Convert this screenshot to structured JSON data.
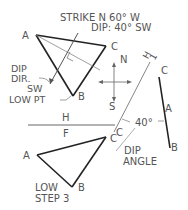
{
  "header": {
    "strike": "STRIKE  N 60° W",
    "dip": "DIP: 40° SW"
  },
  "top_view": {
    "vertex_a": "A",
    "vertex_b": "B",
    "vertex_c": "C",
    "dip_dir_line1": "DIP",
    "dip_dir_line2": "DIR.",
    "dip_dir_line3": "SW",
    "low_point": "LOW PT"
  },
  "compass": {
    "north": "N",
    "south": "S"
  },
  "fold_line": {
    "upper": "H",
    "lower": "F",
    "aux_h": "H",
    "aux_1": "1"
  },
  "edge_view": {
    "vertex_c": "C",
    "vertex_a": "A",
    "vertex_b": "B",
    "angle": "40°",
    "dip_angle_line1": "DIP",
    "dip_angle_line2": "ANGLE",
    "fold_c": "C"
  },
  "front_view": {
    "vertex_a": "A",
    "vertex_b": "B",
    "vertex_c": "C",
    "low": "LOW",
    "step": "STEP 3"
  },
  "colors": {
    "line_dark": "#222222",
    "line_light": "#777777",
    "text": "#555555"
  }
}
